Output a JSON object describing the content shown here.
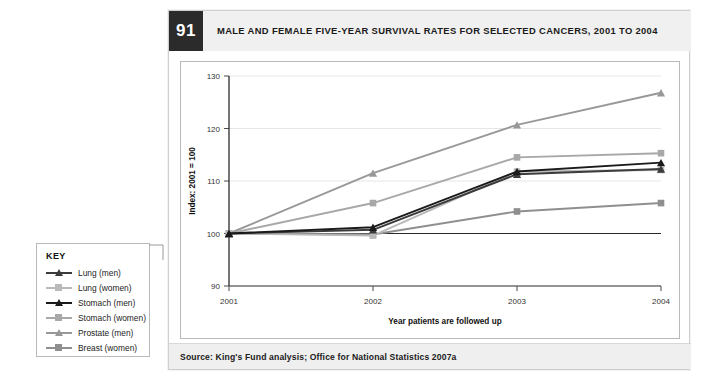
{
  "figure": {
    "number": "91",
    "title": "MALE AND FEMALE FIVE-YEAR SURVIVAL RATES FOR SELECTED CANCERS, 2001 TO 2004",
    "source": "Source: King's Fund analysis; Office for National Statistics 2007a"
  },
  "key": {
    "title": "KEY",
    "items": [
      {
        "label": "Lung (men)",
        "color": "#3b3b3b",
        "marker": "triangle"
      },
      {
        "label": "Lung (women)",
        "color": "#b9b9b9",
        "marker": "square"
      },
      {
        "label": "Stomach (men)",
        "color": "#1a1a1a",
        "marker": "triangle"
      },
      {
        "label": "Stomach (women)",
        "color": "#a8a8a8",
        "marker": "square"
      },
      {
        "label": "Prostate (men)",
        "color": "#989898",
        "marker": "triangle"
      },
      {
        "label": "Breast (women)",
        "color": "#8f8f8f",
        "marker": "square"
      }
    ]
  },
  "chart_data": {
    "type": "line",
    "title": "MALE AND FEMALE FIVE-YEAR SURVIVAL RATES FOR SELECTED CANCERS, 2001 TO 2004",
    "xlabel": "Year patients are followed up",
    "ylabel": "Index: 2001 = 100",
    "categories": [
      "2001",
      "2002",
      "2003",
      "2004"
    ],
    "x_tick_labels": [
      "2001",
      "2002",
      "2003",
      "2004"
    ],
    "y_tick_labels": [
      "90",
      "100",
      "110",
      "120",
      "130"
    ],
    "ylim": [
      90,
      130
    ],
    "y_ticks": [
      90,
      100,
      110,
      120,
      130
    ],
    "grid": "horizontal",
    "reference_line": 100,
    "legend_position": "external-left",
    "series": [
      {
        "name": "Lung (men)",
        "color": "#3b3b3b",
        "marker": "triangle",
        "values": [
          100,
          100.7,
          111.3,
          112.3
        ]
      },
      {
        "name": "Lung (women)",
        "color": "#b9b9b9",
        "marker": "square",
        "values": [
          100,
          99.6,
          111.8,
          112.1
        ]
      },
      {
        "name": "Stomach (men)",
        "color": "#1a1a1a",
        "marker": "triangle",
        "values": [
          100,
          101.2,
          111.8,
          113.5
        ]
      },
      {
        "name": "Stomach (women)",
        "color": "#a8a8a8",
        "marker": "square",
        "values": [
          100,
          105.8,
          114.5,
          115.3
        ]
      },
      {
        "name": "Prostate (men)",
        "color": "#989898",
        "marker": "triangle",
        "values": [
          100,
          111.5,
          120.7,
          126.8
        ]
      },
      {
        "name": "Breast (women)",
        "color": "#8f8f8f",
        "marker": "square",
        "values": [
          100,
          99.8,
          104.2,
          105.8
        ]
      }
    ]
  }
}
